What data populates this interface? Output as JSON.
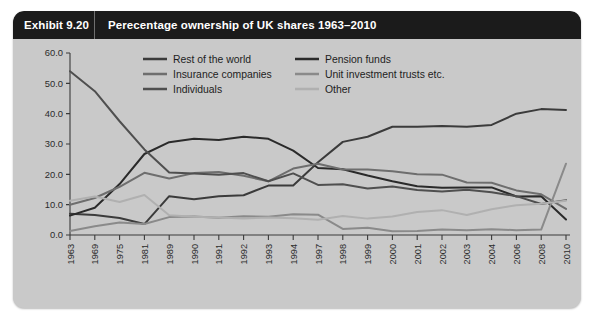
{
  "header": {
    "exhibit_number": "Exhibit 9.20",
    "title": "Perecentage ownership of UK shares 1963–2010"
  },
  "colors": {
    "card_background": "#c9c9c9",
    "header_background": "#1b1b1b",
    "header_text": "#ffffff",
    "axis": "#3a3a3a",
    "rest_of_the_world": "#3b3b3b",
    "pension_funds": "#2a2a2a",
    "insurance_companies": "#6e6e6e",
    "unit_investment_trusts": "#8a8a8a",
    "individuals": "#4f4f4f",
    "other": "#b0b0b0"
  },
  "legend": {
    "position": "top-inside",
    "entries": [
      {
        "label": "Rest of the world",
        "color": "#3b3b3b",
        "column": 1,
        "row": 1
      },
      {
        "label": "Insurance companies",
        "color": "#6e6e6e",
        "column": 1,
        "row": 2
      },
      {
        "label": "Individuals",
        "color": "#4f4f4f",
        "column": 1,
        "row": 3
      },
      {
        "label": "Pension funds",
        "color": "#2a2a2a",
        "column": 2,
        "row": 1
      },
      {
        "label": "Unit investment trusts etc.",
        "color": "#8a8a8a",
        "column": 2,
        "row": 2
      },
      {
        "label": "Other",
        "color": "#b0b0b0",
        "column": 2,
        "row": 3
      }
    ]
  },
  "axes": {
    "y_tick_labels": [
      "0.0",
      "10.0",
      "20.0",
      "30.0",
      "40.0",
      "50.0",
      "60.0"
    ],
    "y_tick_values": [
      0,
      10,
      20,
      30,
      40,
      50,
      60
    ],
    "x_tick_labels": [
      "1963",
      "1969",
      "1975",
      "1981",
      "1989",
      "1990",
      "1991",
      "1992",
      "1993",
      "1994",
      "1997",
      "1998",
      "1999",
      "2000",
      "2001",
      "2002",
      "2003",
      "2004",
      "2006",
      "2008",
      "2010"
    ]
  },
  "chart_data": {
    "type": "line",
    "title": "Perecentage ownership of UK shares 1963–2010",
    "xlabel": "",
    "ylabel": "",
    "ylim": [
      0,
      60
    ],
    "grid": false,
    "legend_position": "top-inside",
    "categories": [
      "1963",
      "1969",
      "1975",
      "1981",
      "1989",
      "1990",
      "1991",
      "1992",
      "1993",
      "1994",
      "1997",
      "1998",
      "1999",
      "2000",
      "2001",
      "2002",
      "2003",
      "2004",
      "2006",
      "2008",
      "2010"
    ],
    "series": [
      {
        "name": "Rest of the world",
        "color": "#3b3b3b",
        "values": [
          7.0,
          6.6,
          5.6,
          3.6,
          12.8,
          11.8,
          12.8,
          13.1,
          16.3,
          16.3,
          24.0,
          30.7,
          32.4,
          35.7,
          35.7,
          35.9,
          35.7,
          36.3,
          40.0,
          41.5,
          41.2
        ]
      },
      {
        "name": "Pension funds",
        "color": "#2a2a2a",
        "values": [
          6.4,
          9.0,
          16.8,
          26.7,
          30.6,
          31.7,
          31.3,
          32.4,
          31.7,
          27.8,
          22.1,
          21.7,
          19.6,
          17.7,
          16.1,
          15.6,
          15.7,
          15.7,
          12.7,
          12.8,
          5.1
        ]
      },
      {
        "name": "Insurance companies",
        "color": "#6e6e6e",
        "values": [
          10.0,
          12.2,
          15.9,
          20.5,
          18.6,
          20.4,
          20.8,
          19.5,
          17.7,
          21.9,
          23.5,
          21.6,
          21.6,
          21.0,
          20.0,
          19.9,
          17.3,
          17.2,
          14.7,
          13.4,
          8.6
        ]
      },
      {
        "name": "Unit investment trusts etc.",
        "color": "#8a8a8a",
        "values": [
          1.3,
          2.9,
          4.1,
          3.6,
          5.9,
          6.1,
          5.7,
          6.2,
          6.0,
          6.8,
          6.7,
          2.0,
          2.4,
          1.2,
          1.3,
          1.8,
          1.6,
          1.9,
          1.6,
          1.8,
          23.5
        ]
      },
      {
        "name": "Individuals",
        "color": "#4f4f4f",
        "values": [
          54.0,
          47.4,
          37.5,
          28.2,
          20.6,
          20.3,
          19.9,
          20.4,
          17.7,
          20.3,
          16.5,
          16.7,
          15.3,
          16.0,
          14.8,
          14.3,
          14.9,
          14.1,
          12.8,
          10.2,
          11.5
        ]
      },
      {
        "name": "Other",
        "color": "#b0b0b0",
        "values": [
          11.3,
          12.7,
          10.9,
          13.2,
          6.5,
          6.0,
          5.8,
          5.4,
          5.8,
          5.5,
          5.0,
          6.3,
          5.4,
          6.1,
          7.6,
          8.2,
          6.6,
          8.5,
          9.8,
          10.3,
          11.3
        ]
      }
    ]
  }
}
